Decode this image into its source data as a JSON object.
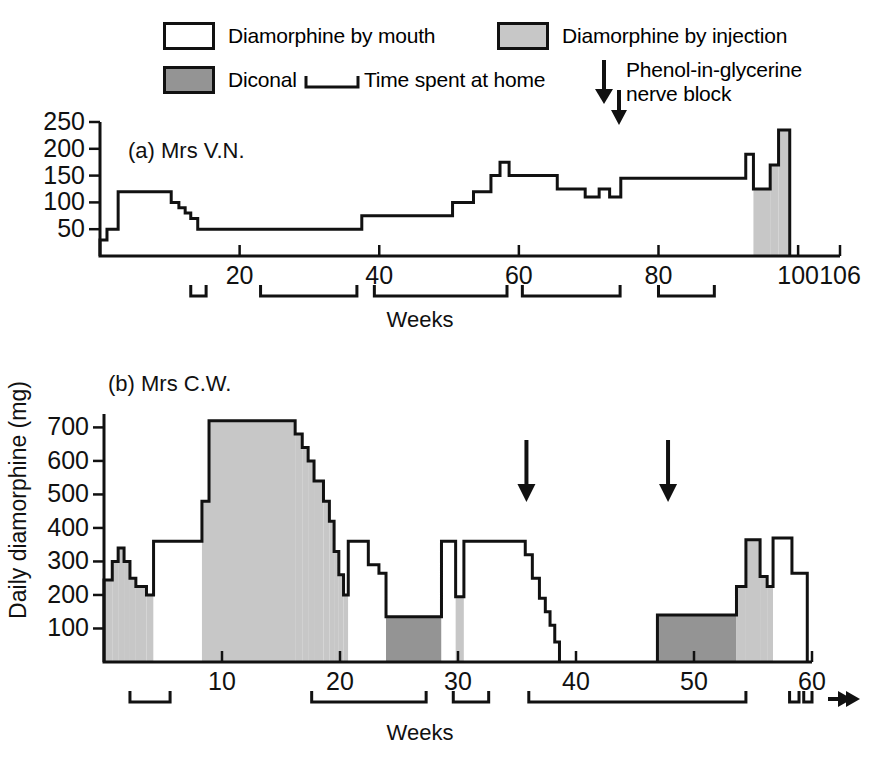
{
  "legend": {
    "items": [
      {
        "id": "diamorphine-mouth",
        "label": "Diamorphine by mouth",
        "swatch": "white"
      },
      {
        "id": "diamorphine-injection",
        "label": "Diamorphine by injection",
        "swatch": "light-grey"
      },
      {
        "id": "diconal",
        "label": "Diconal",
        "swatch": "dark-grey"
      },
      {
        "id": "time-at-home",
        "label": "Time spent at home",
        "swatch": "bracket"
      },
      {
        "id": "nerve-block",
        "label": "Phenol-in-glycerine nerve block",
        "label_line1": "Phenol-in-glycerine",
        "label_line2": "nerve block",
        "swatch": "down-arrow"
      }
    ]
  },
  "axis_label_y": "Daily diamorphine (mg)",
  "colors": {
    "mouth": "#ffffff",
    "injection": "#c7c7c7",
    "diconal": "#949494",
    "ink": "#111111"
  },
  "chart_data": [
    {
      "id": "panel-a",
      "type": "area",
      "title": "(a) Mrs V.N.",
      "xlabel": "Weeks",
      "ylabel": "Daily diamorphine (mg)",
      "xlim": [
        0,
        106
      ],
      "ylim": [
        0,
        250
      ],
      "yticks": [
        50,
        100,
        150,
        200,
        250
      ],
      "xticks": [
        20,
        40,
        60,
        80,
        100,
        106
      ],
      "grid": false,
      "legend_position": "top",
      "step_series_note": "Stepped daily dose; each segment is [week_start, week_end, dose_mg, drug]",
      "segments": [
        {
          "x0": 0,
          "x1": 1.0,
          "y": 30,
          "drug": "mouth"
        },
        {
          "x0": 1.0,
          "x1": 2.6,
          "y": 50,
          "drug": "mouth"
        },
        {
          "x0": 2.6,
          "x1": 10.2,
          "y": 120,
          "drug": "mouth"
        },
        {
          "x0": 10.2,
          "x1": 11.3,
          "y": 100,
          "drug": "mouth"
        },
        {
          "x0": 11.3,
          "x1": 12.2,
          "y": 90,
          "drug": "mouth"
        },
        {
          "x0": 12.2,
          "x1": 13.0,
          "y": 80,
          "drug": "mouth"
        },
        {
          "x0": 13.0,
          "x1": 14.0,
          "y": 70,
          "drug": "mouth"
        },
        {
          "x0": 14.0,
          "x1": 37.5,
          "y": 50,
          "drug": "mouth"
        },
        {
          "x0": 37.5,
          "x1": 50.5,
          "y": 75,
          "drug": "mouth"
        },
        {
          "x0": 50.5,
          "x1": 53.5,
          "y": 100,
          "drug": "mouth"
        },
        {
          "x0": 53.5,
          "x1": 56.0,
          "y": 120,
          "drug": "mouth"
        },
        {
          "x0": 56.0,
          "x1": 57.3,
          "y": 150,
          "drug": "mouth"
        },
        {
          "x0": 57.3,
          "x1": 58.6,
          "y": 175,
          "drug": "mouth"
        },
        {
          "x0": 58.6,
          "x1": 65.5,
          "y": 150,
          "drug": "mouth"
        },
        {
          "x0": 65.5,
          "x1": 69.5,
          "y": 125,
          "drug": "mouth"
        },
        {
          "x0": 69.5,
          "x1": 71.5,
          "y": 110,
          "drug": "mouth"
        },
        {
          "x0": 71.5,
          "x1": 73.0,
          "y": 125,
          "drug": "mouth"
        },
        {
          "x0": 73.0,
          "x1": 74.6,
          "y": 110,
          "drug": "mouth"
        },
        {
          "x0": 74.6,
          "x1": 92.5,
          "y": 145,
          "drug": "mouth"
        },
        {
          "x0": 92.5,
          "x1": 93.6,
          "y": 190,
          "drug": "mouth"
        },
        {
          "x0": 93.6,
          "x1": 96.0,
          "y": 125,
          "drug": "injection"
        },
        {
          "x0": 96.0,
          "x1": 97.2,
          "y": 170,
          "drug": "injection"
        },
        {
          "x0": 97.2,
          "x1": 98.8,
          "y": 235,
          "drug": "injection"
        }
      ],
      "home_periods": [
        {
          "x0": 13.0,
          "x1": 15.2
        },
        {
          "x0": 23.0,
          "x1": 36.8
        },
        {
          "x0": 39.3,
          "x1": 58.3
        },
        {
          "x0": 60.5,
          "x1": 74.5
        },
        {
          "x0": 80.0,
          "x1": 88.0
        }
      ],
      "nerve_block_arrows": [
        74.5
      ]
    },
    {
      "id": "panel-b",
      "type": "area",
      "title": "(b) Mrs C.W.",
      "xlabel": "Weeks",
      "ylabel": "Daily diamorphine (mg)",
      "xlim": [
        0,
        60
      ],
      "ylim": [
        0,
        740
      ],
      "yticks": [
        100,
        200,
        300,
        400,
        500,
        600,
        700
      ],
      "xticks": [
        10,
        20,
        30,
        40,
        50,
        60
      ],
      "grid": false,
      "legend_position": "top",
      "segments": [
        {
          "x0": 0.0,
          "x1": 0.7,
          "y": 245,
          "drug": "injection"
        },
        {
          "x0": 0.7,
          "x1": 1.2,
          "y": 300,
          "drug": "injection"
        },
        {
          "x0": 1.2,
          "x1": 1.7,
          "y": 340,
          "drug": "injection"
        },
        {
          "x0": 1.7,
          "x1": 2.2,
          "y": 300,
          "drug": "injection"
        },
        {
          "x0": 2.2,
          "x1": 2.7,
          "y": 250,
          "drug": "injection"
        },
        {
          "x0": 2.7,
          "x1": 3.6,
          "y": 225,
          "drug": "injection"
        },
        {
          "x0": 3.6,
          "x1": 4.2,
          "y": 200,
          "drug": "injection"
        },
        {
          "x0": 4.2,
          "x1": 8.3,
          "y": 360,
          "drug": "mouth"
        },
        {
          "x0": 8.3,
          "x1": 8.9,
          "y": 480,
          "drug": "injection"
        },
        {
          "x0": 8.9,
          "x1": 16.2,
          "y": 720,
          "drug": "injection"
        },
        {
          "x0": 16.2,
          "x1": 16.8,
          "y": 680,
          "drug": "injection"
        },
        {
          "x0": 16.8,
          "x1": 17.3,
          "y": 640,
          "drug": "injection"
        },
        {
          "x0": 17.3,
          "x1": 17.8,
          "y": 600,
          "drug": "injection"
        },
        {
          "x0": 17.8,
          "x1": 18.6,
          "y": 540,
          "drug": "injection"
        },
        {
          "x0": 18.6,
          "x1": 19.1,
          "y": 480,
          "drug": "injection"
        },
        {
          "x0": 19.1,
          "x1": 19.5,
          "y": 420,
          "drug": "injection"
        },
        {
          "x0": 19.5,
          "x1": 19.9,
          "y": 330,
          "drug": "injection"
        },
        {
          "x0": 19.9,
          "x1": 20.3,
          "y": 260,
          "drug": "injection"
        },
        {
          "x0": 20.3,
          "x1": 20.7,
          "y": 200,
          "drug": "injection"
        },
        {
          "x0": 20.7,
          "x1": 22.4,
          "y": 360,
          "drug": "mouth"
        },
        {
          "x0": 22.4,
          "x1": 23.3,
          "y": 290,
          "drug": "mouth"
        },
        {
          "x0": 23.3,
          "x1": 23.9,
          "y": 265,
          "drug": "mouth"
        },
        {
          "x0": 23.9,
          "x1": 28.6,
          "y": 135,
          "drug": "diconal"
        },
        {
          "x0": 28.6,
          "x1": 29.8,
          "y": 360,
          "drug": "mouth"
        },
        {
          "x0": 29.8,
          "x1": 30.5,
          "y": 195,
          "drug": "injection"
        },
        {
          "x0": 30.5,
          "x1": 35.7,
          "y": 360,
          "drug": "mouth"
        },
        {
          "x0": 35.7,
          "x1": 36.3,
          "y": 320,
          "drug": "mouth"
        },
        {
          "x0": 36.3,
          "x1": 36.9,
          "y": 250,
          "drug": "mouth"
        },
        {
          "x0": 36.9,
          "x1": 37.4,
          "y": 190,
          "drug": "mouth"
        },
        {
          "x0": 37.4,
          "x1": 37.8,
          "y": 150,
          "drug": "mouth"
        },
        {
          "x0": 37.8,
          "x1": 38.2,
          "y": 110,
          "drug": "mouth"
        },
        {
          "x0": 38.2,
          "x1": 38.6,
          "y": 60,
          "drug": "mouth"
        },
        {
          "x0": 46.9,
          "x1": 53.6,
          "y": 140,
          "drug": "diconal"
        },
        {
          "x0": 53.6,
          "x1": 54.4,
          "y": 225,
          "drug": "injection"
        },
        {
          "x0": 54.4,
          "x1": 55.6,
          "y": 365,
          "drug": "injection"
        },
        {
          "x0": 55.6,
          "x1": 56.2,
          "y": 255,
          "drug": "injection"
        },
        {
          "x0": 56.2,
          "x1": 56.7,
          "y": 225,
          "drug": "injection"
        },
        {
          "x0": 56.7,
          "x1": 58.3,
          "y": 370,
          "drug": "mouth"
        },
        {
          "x0": 58.3,
          "x1": 59.6,
          "y": 265,
          "drug": "mouth"
        }
      ],
      "home_periods": [
        {
          "x0": 2.2,
          "x1": 5.6
        },
        {
          "x0": 17.6,
          "x1": 27.3
        },
        {
          "x0": 29.6,
          "x1": 32.6
        },
        {
          "x0": 36.0,
          "x1": 54.4
        },
        {
          "x0": 58.1,
          "x1": 58.9
        },
        {
          "x0": 59.3,
          "x1": 60.0
        }
      ],
      "nerve_block_arrows": [
        35.8,
        47.8
      ],
      "continues_arrow": true
    }
  ]
}
